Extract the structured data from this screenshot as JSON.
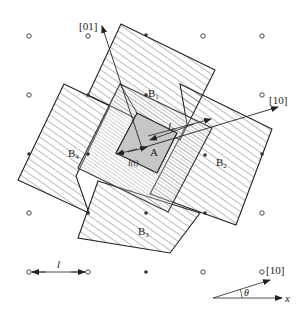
{
  "diagram": {
    "labels": {
      "dir_01": "[01]",
      "dir_10_top": "[10]",
      "dir_10_bottom": "[10]",
      "B1": "B",
      "B1_sub": "1",
      "B2": "B",
      "B2_sub": "2",
      "B3": "B",
      "B3_sub": "3",
      "B4": "B",
      "B4_sub": "4",
      "A": "A",
      "l0": "l",
      "l0_sub": "0",
      "lt": "l",
      "lt_paren": "(t)",
      "l_scale": "l",
      "theta": "θ",
      "x_axis": "x"
    },
    "colors": {
      "line": "#222222",
      "hatch": "#555555",
      "inner_fill": "#c8c8c8",
      "background": "#ffffff"
    }
  }
}
